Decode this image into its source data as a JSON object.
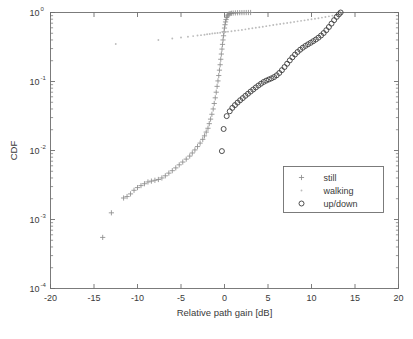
{
  "chart_data": {
    "type": "scatter",
    "title": "",
    "xlabel": "Relative path gain [dB]",
    "ylabel": "CDF",
    "xlim": [
      -20,
      20
    ],
    "ylim": [
      0.0001,
      1
    ],
    "yscale": "log",
    "xticks": [
      -20,
      -15,
      -10,
      -5,
      0,
      5,
      10,
      15,
      20
    ],
    "xticklabels": [
      "-20",
      "-15",
      "-10",
      "-5",
      "0",
      "5",
      "10",
      "15",
      "20"
    ],
    "yticks": [
      1,
      0.1,
      0.01,
      0.001,
      0.0001
    ],
    "yticklabels": [
      "10^0",
      "10^-1",
      "10^-2",
      "10^-3",
      "10^-4"
    ],
    "ytick_bases": [
      "10",
      "10",
      "10",
      "10",
      "10"
    ],
    "ytick_exponents": [
      "0",
      "-1",
      "-2",
      "-3",
      "-4"
    ],
    "grid": false,
    "legend_position": "lower right",
    "series": [
      {
        "name": "still",
        "marker": "plus",
        "color": "#8c8c8c",
        "points": [
          [
            -14.0,
            0.00055
          ],
          [
            -13.0,
            0.00125
          ],
          [
            -11.6,
            0.00205
          ],
          [
            -11.2,
            0.00215
          ],
          [
            -10.8,
            0.00235
          ],
          [
            -10.4,
            0.00265
          ],
          [
            -10.0,
            0.0029
          ],
          [
            -9.6,
            0.0031
          ],
          [
            -9.2,
            0.0033
          ],
          [
            -8.8,
            0.0035
          ],
          [
            -8.4,
            0.0036
          ],
          [
            -8.0,
            0.0037
          ],
          [
            -7.6,
            0.0038
          ],
          [
            -7.2,
            0.004
          ],
          [
            -6.8,
            0.0043
          ],
          [
            -6.4,
            0.0047
          ],
          [
            -6.0,
            0.0051
          ],
          [
            -5.6,
            0.0056
          ],
          [
            -5.2,
            0.0062
          ],
          [
            -4.8,
            0.0068
          ],
          [
            -4.4,
            0.0075
          ],
          [
            -4.0,
            0.0083
          ],
          [
            -3.7,
            0.0092
          ],
          [
            -3.4,
            0.0102
          ],
          [
            -3.1,
            0.0114
          ],
          [
            -2.8,
            0.0128
          ],
          [
            -2.5,
            0.0145
          ],
          [
            -2.3,
            0.0163
          ],
          [
            -2.1,
            0.0185
          ],
          [
            -1.9,
            0.021
          ],
          [
            -1.75,
            0.0245
          ],
          [
            -1.6,
            0.0285
          ],
          [
            -1.45,
            0.0335
          ],
          [
            -1.3,
            0.04
          ],
          [
            -1.18,
            0.048
          ],
          [
            -1.06,
            0.058
          ],
          [
            -0.95,
            0.07
          ],
          [
            -0.85,
            0.085
          ],
          [
            -0.75,
            0.102
          ],
          [
            -0.66,
            0.122
          ],
          [
            -0.58,
            0.146
          ],
          [
            -0.5,
            0.175
          ],
          [
            -0.43,
            0.21
          ],
          [
            -0.36,
            0.25
          ],
          [
            -0.29,
            0.295
          ],
          [
            -0.23,
            0.345
          ],
          [
            -0.17,
            0.4
          ],
          [
            -0.11,
            0.46
          ],
          [
            -0.05,
            0.525
          ],
          [
            0.0,
            0.595
          ],
          [
            0.06,
            0.665
          ],
          [
            0.12,
            0.73
          ],
          [
            0.18,
            0.79
          ],
          [
            0.25,
            0.845
          ],
          [
            0.33,
            0.89
          ],
          [
            0.42,
            0.925
          ],
          [
            0.52,
            0.95
          ],
          [
            0.65,
            0.965
          ],
          [
            0.8,
            0.975
          ],
          [
            1.0,
            0.982
          ],
          [
            1.25,
            0.987
          ],
          [
            1.5,
            0.991
          ],
          [
            1.75,
            0.994
          ],
          [
            2.0,
            0.996
          ],
          [
            2.25,
            0.997
          ],
          [
            2.5,
            0.998
          ],
          [
            2.75,
            0.999
          ],
          [
            3.0,
            1.0
          ]
        ]
      },
      {
        "name": "walking",
        "marker": "dot",
        "color": "#bcbcbc",
        "points": [
          [
            -12.5,
            0.35
          ],
          [
            -7.6,
            0.4
          ],
          [
            -6.0,
            0.42
          ],
          [
            -5.0,
            0.435
          ],
          [
            -4.2,
            0.445
          ],
          [
            -3.6,
            0.455
          ],
          [
            -3.1,
            0.463
          ],
          [
            -2.7,
            0.47
          ],
          [
            -2.3,
            0.477
          ],
          [
            -2.0,
            0.483
          ],
          [
            -1.7,
            0.489
          ],
          [
            -1.4,
            0.495
          ],
          [
            -1.1,
            0.5
          ],
          [
            -0.8,
            0.505
          ],
          [
            -0.5,
            0.51
          ],
          [
            -0.2,
            0.516
          ],
          [
            0.1,
            0.522
          ],
          [
            0.4,
            0.528
          ],
          [
            0.8,
            0.535
          ],
          [
            1.2,
            0.543
          ],
          [
            1.6,
            0.551
          ],
          [
            2.0,
            0.56
          ],
          [
            2.4,
            0.57
          ],
          [
            2.8,
            0.58
          ],
          [
            3.2,
            0.59
          ],
          [
            3.6,
            0.601
          ],
          [
            4.0,
            0.612
          ],
          [
            4.4,
            0.623
          ],
          [
            4.8,
            0.634
          ],
          [
            5.2,
            0.646
          ],
          [
            5.6,
            0.658
          ],
          [
            6.0,
            0.67
          ],
          [
            6.4,
            0.682
          ],
          [
            6.8,
            0.694
          ],
          [
            7.2,
            0.706
          ],
          [
            7.6,
            0.718
          ],
          [
            8.0,
            0.731
          ],
          [
            8.4,
            0.744
          ],
          [
            8.8,
            0.757
          ],
          [
            9.2,
            0.77
          ],
          [
            9.6,
            0.784
          ],
          [
            10.0,
            0.798
          ],
          [
            10.4,
            0.812
          ],
          [
            10.8,
            0.827
          ],
          [
            11.2,
            0.843
          ],
          [
            11.6,
            0.86
          ],
          [
            12.0,
            0.879
          ],
          [
            12.4,
            0.9
          ],
          [
            12.8,
            0.93
          ],
          [
            13.1,
            0.965
          ],
          [
            13.3,
            1.0
          ]
        ]
      },
      {
        "name": "up/down",
        "marker": "circle",
        "color": "#3c3c3c",
        "points": [
          [
            -0.3,
            0.0098
          ],
          [
            -0.1,
            0.0205
          ],
          [
            0.25,
            0.0315
          ],
          [
            0.6,
            0.037
          ],
          [
            0.9,
            0.0415
          ],
          [
            1.2,
            0.0455
          ],
          [
            1.5,
            0.0495
          ],
          [
            1.8,
            0.0535
          ],
          [
            2.1,
            0.0575
          ],
          [
            2.4,
            0.062
          ],
          [
            2.7,
            0.0665
          ],
          [
            3.0,
            0.0715
          ],
          [
            3.3,
            0.0765
          ],
          [
            3.6,
            0.082
          ],
          [
            3.9,
            0.0875
          ],
          [
            4.2,
            0.093
          ],
          [
            4.5,
            0.0985
          ],
          [
            4.8,
            0.103
          ],
          [
            5.1,
            0.107
          ],
          [
            5.4,
            0.111
          ],
          [
            5.7,
            0.116
          ],
          [
            6.0,
            0.123
          ],
          [
            6.3,
            0.133
          ],
          [
            6.6,
            0.146
          ],
          [
            6.9,
            0.162
          ],
          [
            7.2,
            0.181
          ],
          [
            7.5,
            0.202
          ],
          [
            7.8,
            0.224
          ],
          [
            8.1,
            0.246
          ],
          [
            8.4,
            0.268
          ],
          [
            8.7,
            0.289
          ],
          [
            9.0,
            0.309
          ],
          [
            9.3,
            0.328
          ],
          [
            9.6,
            0.346
          ],
          [
            9.9,
            0.364
          ],
          [
            10.2,
            0.384
          ],
          [
            10.5,
            0.406
          ],
          [
            10.8,
            0.432
          ],
          [
            11.1,
            0.464
          ],
          [
            11.4,
            0.504
          ],
          [
            11.7,
            0.554
          ],
          [
            12.0,
            0.616
          ],
          [
            12.3,
            0.69
          ],
          [
            12.6,
            0.775
          ],
          [
            12.9,
            0.865
          ],
          [
            13.15,
            0.94
          ],
          [
            13.35,
            1.0
          ]
        ]
      }
    ]
  },
  "legend": {
    "entries": [
      {
        "label": "still",
        "marker": "plus"
      },
      {
        "label": "walking",
        "marker": "dot"
      },
      {
        "label": "up/down",
        "marker": "circle"
      }
    ]
  }
}
